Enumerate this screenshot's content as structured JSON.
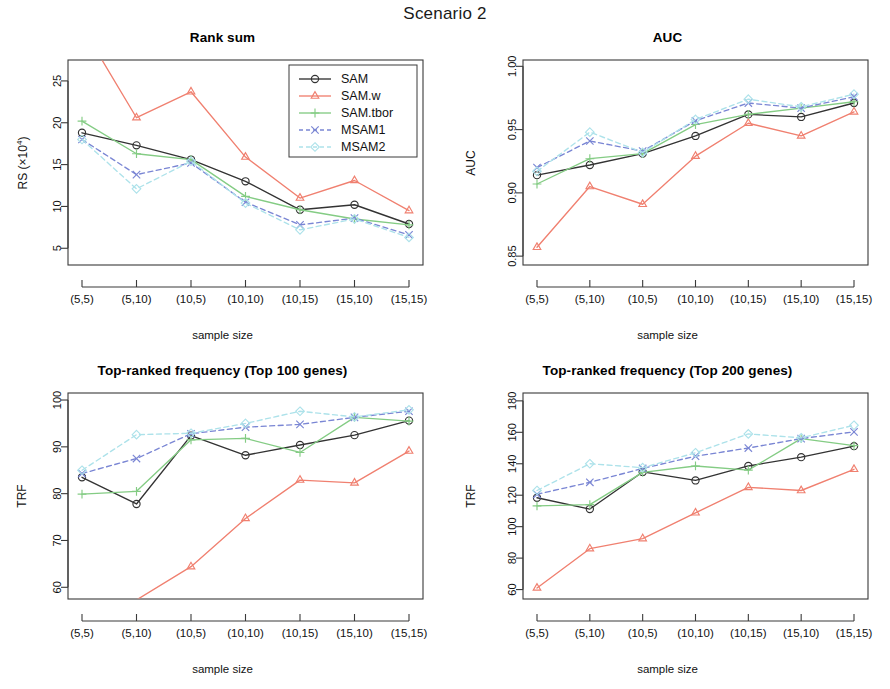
{
  "figure": {
    "main_title": "Scenario 2"
  },
  "series_styles": [
    {
      "name": "SAM",
      "color": "#333333",
      "marker": "circle",
      "dash": "none"
    },
    {
      "name": "SAM.w",
      "color": "#F08070",
      "marker": "triangle",
      "dash": "none"
    },
    {
      "name": "SAM.tbor",
      "color": "#84CC84",
      "marker": "plus",
      "dash": "none"
    },
    {
      "name": "MSAM1",
      "color": "#7A86D4",
      "marker": "cross",
      "dash": "dashed"
    },
    {
      "name": "MSAM2",
      "color": "#ADE2EA",
      "marker": "diamond",
      "dash": "dashed"
    }
  ],
  "legend": {
    "visible_in_panel": "rank-sum",
    "position": "top-right",
    "entries": [
      "SAM",
      "SAM.w",
      "SAM.tbor",
      "MSAM1",
      "MSAM2"
    ]
  },
  "chart_data": [
    {
      "type": "line",
      "panel_id": "rank-sum",
      "title": "Rank sum",
      "xlabel": "sample size",
      "ylabel": "RS (×10⁴)",
      "ylabel_base": "RS (×10",
      "ylabel_sup": "4",
      "ylabel_tail": ")",
      "categories": [
        "(5,5)",
        "(5,10)",
        "(10,5)",
        "(10,10)",
        "(10,15)",
        "(15,10)",
        "(15,15)"
      ],
      "ylim": [
        3.0,
        27.5
      ],
      "yticks": [
        5,
        10,
        15,
        20,
        25
      ],
      "ytick_labels": [
        "5",
        "10",
        "15",
        "20",
        "25"
      ],
      "grid": false,
      "legend_position": "top-right",
      "series": [
        {
          "name": "SAM",
          "values": [
            18.8,
            17.3,
            15.6,
            13.0,
            9.6,
            10.2,
            7.9
          ]
        },
        {
          "name": "SAM.w",
          "values": [
            31.5,
            20.6,
            23.7,
            15.9,
            11.0,
            13.1,
            9.5
          ],
          "clipped_above": [
            0
          ]
        },
        {
          "name": "SAM.tbor",
          "values": [
            20.2,
            16.3,
            15.6,
            11.2,
            9.6,
            8.5,
            7.8
          ]
        },
        {
          "name": "MSAM1",
          "values": [
            18.0,
            13.8,
            15.2,
            10.5,
            7.8,
            8.6,
            6.6
          ]
        },
        {
          "name": "MSAM2",
          "values": [
            18.0,
            12.1,
            15.4,
            10.4,
            7.2,
            8.5,
            6.3
          ]
        }
      ]
    },
    {
      "type": "line",
      "panel_id": "auc",
      "title": "AUC",
      "xlabel": "sample size",
      "ylabel": "AUC",
      "categories": [
        "(5,5)",
        "(5,10)",
        "(10,5)",
        "(10,10)",
        "(10,15)",
        "(15,10)",
        "(15,15)"
      ],
      "ylim": [
        0.843,
        1.005
      ],
      "yticks": [
        0.85,
        0.9,
        0.95,
        1.0
      ],
      "ytick_labels": [
        "0.85",
        "0.90",
        "0.95",
        "1.00"
      ],
      "grid": false,
      "legend_position": "none",
      "series": [
        {
          "name": "SAM",
          "values": [
            0.914,
            0.922,
            0.931,
            0.945,
            0.962,
            0.96,
            0.971
          ]
        },
        {
          "name": "SAM.w",
          "values": [
            0.857,
            0.905,
            0.891,
            0.929,
            0.955,
            0.945,
            0.964
          ]
        },
        {
          "name": "SAM.tbor",
          "values": [
            0.907,
            0.927,
            0.931,
            0.954,
            0.962,
            0.967,
            0.972
          ]
        },
        {
          "name": "MSAM1",
          "values": [
            0.92,
            0.941,
            0.933,
            0.957,
            0.971,
            0.967,
            0.976
          ]
        },
        {
          "name": "MSAM2",
          "values": [
            0.917,
            0.948,
            0.932,
            0.958,
            0.974,
            0.968,
            0.978
          ]
        }
      ]
    },
    {
      "type": "line",
      "panel_id": "trf-top100",
      "title": "Top-ranked frequency (Top 100 genes)",
      "xlabel": "sample size",
      "ylabel": "TRF",
      "categories": [
        "(5,5)",
        "(5,10)",
        "(10,5)",
        "(10,10)",
        "(10,15)",
        "(15,10)",
        "(15,15)"
      ],
      "ylim": [
        57.5,
        101.5
      ],
      "yticks": [
        60,
        70,
        80,
        90,
        100
      ],
      "ytick_labels": [
        "60",
        "70",
        "80",
        "90",
        "100"
      ],
      "grid": false,
      "legend_position": "none",
      "series": [
        {
          "name": "SAM",
          "values": [
            83.5,
            77.8,
            92.4,
            88.2,
            90.4,
            92.5,
            95.6
          ]
        },
        {
          "name": "SAM.w",
          "values": [
            52.0,
            57.3,
            64.4,
            74.7,
            82.9,
            82.3,
            89.1
          ],
          "clipped_below": [
            0,
            1
          ]
        },
        {
          "name": "SAM.tbor",
          "values": [
            79.9,
            80.5,
            91.5,
            91.8,
            88.8,
            96.3,
            95.5
          ]
        },
        {
          "name": "MSAM1",
          "values": [
            84.3,
            87.5,
            92.8,
            94.2,
            94.8,
            96.3,
            97.6
          ]
        },
        {
          "name": "MSAM2",
          "values": [
            85.0,
            92.6,
            92.9,
            95.0,
            97.6,
            96.4,
            97.9
          ]
        }
      ]
    },
    {
      "type": "line",
      "panel_id": "trf-top200",
      "title": "Top-ranked frequency (Top 200 genes)",
      "xlabel": "sample size",
      "ylabel": "TRF",
      "categories": [
        "(5,5)",
        "(5,10)",
        "(10,5)",
        "(10,10)",
        "(10,15)",
        "(15,10)",
        "(15,15)"
      ],
      "ylim": [
        54,
        185
      ],
      "yticks": [
        60,
        80,
        100,
        120,
        140,
        160,
        180
      ],
      "ytick_labels": [
        "60",
        "80",
        "100",
        "120",
        "140",
        "160",
        "180"
      ],
      "grid": false,
      "legend_position": "none",
      "series": [
        {
          "name": "SAM",
          "values": [
            118.4,
            111.2,
            134.8,
            129.4,
            138.6,
            144.2,
            151.2
          ]
        },
        {
          "name": "SAM.w",
          "values": [
            61.0,
            86.0,
            92.4,
            108.8,
            125.0,
            123.0,
            136.5
          ]
        },
        {
          "name": "SAM.tbor",
          "values": [
            113.2,
            114.0,
            134.5,
            138.6,
            136.0,
            156.0,
            151.5
          ]
        },
        {
          "name": "MSAM1",
          "values": [
            120.6,
            128.2,
            137.0,
            144.8,
            150.0,
            156.0,
            160.3
          ]
        },
        {
          "name": "MSAM2",
          "values": [
            123.0,
            140.0,
            137.5,
            147.0,
            159.0,
            156.5,
            164.5
          ]
        }
      ]
    }
  ]
}
